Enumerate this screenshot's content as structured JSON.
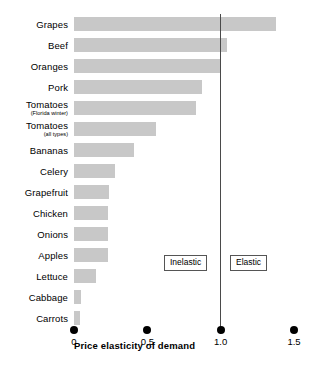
{
  "chart_data": {
    "type": "bar",
    "orientation": "horizontal",
    "title": "",
    "xlabel": "Price elasticity of demand",
    "ylabel": "",
    "xlim": [
      0,
      1.5
    ],
    "xticks": [
      "0",
      "0.5",
      "1.0",
      "1.5"
    ],
    "xtick_values": [
      0,
      0.5,
      1.0,
      1.5
    ],
    "grid": false,
    "bar_color": "#c8c8c8",
    "reference_line": {
      "value": 1.0,
      "color": "#4a4a4a",
      "label": "unit elasticity"
    },
    "annotations": [
      {
        "text": "Inelastic",
        "region": "left-of-unit-line"
      },
      {
        "text": "Elastic",
        "region": "right-of-unit-line"
      }
    ],
    "categories": [
      "Grapes",
      "Beef",
      "Oranges",
      "Pork",
      "Tomatoes",
      "Tomatoes",
      "Bananas",
      "Celery",
      "Grapefruit",
      "Chicken",
      "Onions",
      "Apples",
      "Lettuce",
      "Cabbage",
      "Carrots"
    ],
    "values": [
      1.38,
      1.04,
      1.0,
      0.87,
      0.83,
      0.56,
      0.41,
      0.28,
      0.24,
      0.23,
      0.23,
      0.23,
      0.15,
      0.05,
      0.04
    ],
    "items": [
      {
        "label": "Grapes",
        "sublabel": "",
        "value": 1.38
      },
      {
        "label": "Beef",
        "sublabel": "",
        "value": 1.04
      },
      {
        "label": "Oranges",
        "sublabel": "",
        "value": 1.0
      },
      {
        "label": "Pork",
        "sublabel": "",
        "value": 0.87
      },
      {
        "label": "Tomatoes",
        "sublabel": "(Florida winter)",
        "value": 0.83
      },
      {
        "label": "Tomatoes",
        "sublabel": "(all types)",
        "value": 0.56
      },
      {
        "label": "Bananas",
        "sublabel": "",
        "value": 0.41
      },
      {
        "label": "Celery",
        "sublabel": "",
        "value": 0.28
      },
      {
        "label": "Grapefruit",
        "sublabel": "",
        "value": 0.24
      },
      {
        "label": "Chicken",
        "sublabel": "",
        "value": 0.23
      },
      {
        "label": "Onions",
        "sublabel": "",
        "value": 0.23
      },
      {
        "label": "Apples",
        "sublabel": "",
        "value": 0.23
      },
      {
        "label": "Lettuce",
        "sublabel": "",
        "value": 0.15
      },
      {
        "label": "Cabbage",
        "sublabel": "",
        "value": 0.05
      },
      {
        "label": "Carrots",
        "sublabel": "",
        "value": 0.04
      }
    ]
  },
  "legend": {
    "inelastic": "Inelastic",
    "elastic": "Elastic"
  },
  "axis": {
    "title": "Price elasticity of demand"
  }
}
